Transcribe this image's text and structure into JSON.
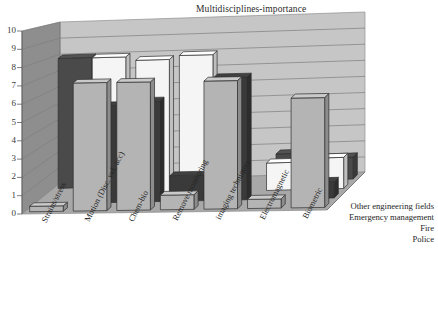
{
  "chart": {
    "title": "Multidisciplines-importance"
  },
  "chart_data": {
    "type": "bar",
    "title": "Multidisciplines-importance",
    "xlabel": "",
    "ylabel": "",
    "ylim": [
      0,
      10
    ],
    "ytick_labels": [
      "0",
      "1",
      "2",
      "3",
      "4",
      "5",
      "6",
      "7",
      "8",
      "9",
      "10"
    ],
    "grid": true,
    "legend_position": "right-depth-axis",
    "three_d": true,
    "depth_axis_order_front_to_back": [
      "Police",
      "Fire",
      "Emergency management",
      "Other engineering fields"
    ],
    "categories": [
      "Strains/stress",
      "Motion (Disc. vel. acc)",
      "Chem-bio",
      "Remove monitoring",
      "imaging techniques",
      "Electromagnetic",
      "Biometric"
    ],
    "series": [
      {
        "name": "Police",
        "color": "#b4b4b4",
        "values": [
          0.3,
          7,
          7,
          0.8,
          7,
          0.5,
          6
        ]
      },
      {
        "name": "Fire",
        "color": "#3a3a3a",
        "values": [
          0,
          5.3,
          5.5,
          1.4,
          6.7,
          0,
          0.9
        ]
      },
      {
        "name": "Emergency management",
        "color": "#f5f5f5",
        "values": [
          0,
          7.5,
          7.3,
          7.5,
          0,
          1.5,
          1.7
        ]
      },
      {
        "name": "Other engineering fields",
        "color": "#4a4a4a",
        "values": [
          7.1,
          0,
          0,
          4,
          0,
          1.5,
          1.2
        ]
      }
    ]
  },
  "axis": {
    "y_ticks": [
      "10",
      "9",
      "8",
      "7",
      "6",
      "5",
      "4",
      "3",
      "2",
      "1",
      "0"
    ]
  },
  "depth_labels": [
    "Other engineering fields",
    "Emergency management",
    "Fire",
    "Police"
  ],
  "category_labels": [
    "Strains/stress",
    "Motion (Disc. vel. acc)",
    "Chem-bio",
    "Remove monitoring",
    "imaging techniques",
    "Electromagnetic",
    "Biometric"
  ]
}
